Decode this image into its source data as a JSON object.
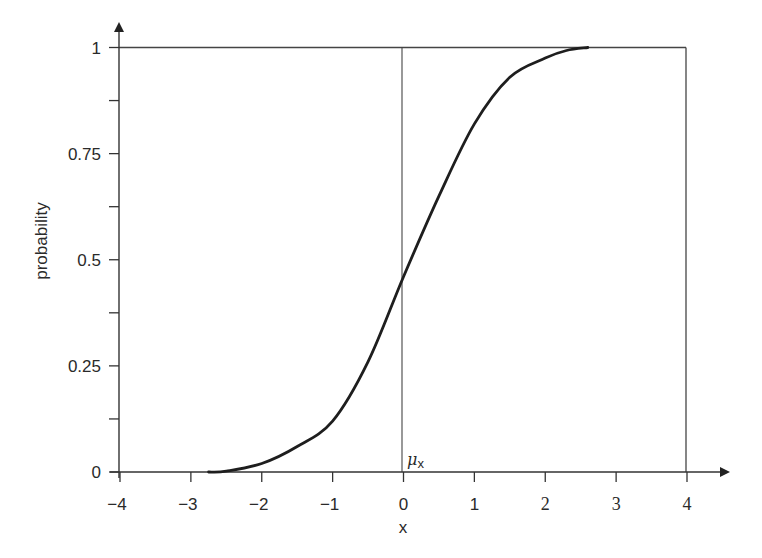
{
  "chart_data": {
    "type": "line",
    "title": "",
    "xlabel": "x",
    "ylabel": "probability",
    "xlim": [
      -4,
      4
    ],
    "ylim": [
      0,
      1
    ],
    "grid": false,
    "legend": null,
    "x_ticks": [
      {
        "value": -4,
        "label": "−4"
      },
      {
        "value": -3,
        "label": "−3"
      },
      {
        "value": -2,
        "label": "−2"
      },
      {
        "value": -1,
        "label": "−1"
      },
      {
        "value": 0,
        "label": "0"
      },
      {
        "value": 1,
        "label": "1"
      },
      {
        "value": 2,
        "label": "2"
      },
      {
        "value": 3,
        "label": "3"
      },
      {
        "value": 4,
        "label": "4"
      }
    ],
    "y_ticks": [
      {
        "value": 0,
        "label": "0"
      },
      {
        "value": 0.125,
        "label": ""
      },
      {
        "value": 0.25,
        "label": "0.25"
      },
      {
        "value": 0.375,
        "label": ""
      },
      {
        "value": 0.5,
        "label": "0.5"
      },
      {
        "value": 0.625,
        "label": ""
      },
      {
        "value": 0.75,
        "label": "0.75"
      },
      {
        "value": 0.875,
        "label": ""
      },
      {
        "value": 1,
        "label": "1"
      }
    ],
    "series": [
      {
        "name": "CDF",
        "description": "S-shaped cumulative distribution curve",
        "x": [
          -2.75,
          -2.5,
          -2.0,
          -1.5,
          -1.0,
          -0.5,
          0.0,
          0.5,
          1.0,
          1.5,
          2.0,
          2.3,
          2.6
        ],
        "y": [
          0.0,
          0.002,
          0.02,
          0.06,
          0.12,
          0.26,
          0.46,
          0.65,
          0.82,
          0.93,
          0.975,
          0.993,
          1.0
        ]
      }
    ],
    "annotations": [
      {
        "type": "vline",
        "x": 0,
        "label": "μ",
        "subscript": "x"
      },
      {
        "type": "hline",
        "y": 1
      },
      {
        "type": "vline",
        "x": 4
      }
    ]
  },
  "labels": {
    "ylabel": "probability",
    "xlabel": "x",
    "mu_symbol": "μ",
    "mu_subscript": "x"
  }
}
